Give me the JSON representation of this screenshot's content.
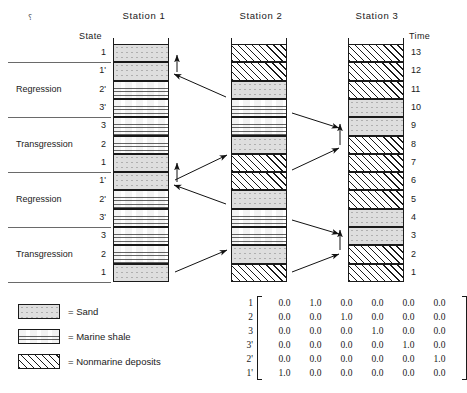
{
  "figure": {
    "state_axis_caption": "State",
    "time_axis_caption": "Time",
    "stray_mark": "⸮"
  },
  "stations": [
    {
      "title": "Station 1",
      "layers": [
        {
          "state": "1",
          "lithology": "sand"
        },
        {
          "state": "1'",
          "lithology": "sand"
        },
        {
          "state": "2'",
          "lithology": "marine-shale"
        },
        {
          "state": "3'",
          "lithology": "marine-shale"
        },
        {
          "state": "3",
          "lithology": "marine-shale"
        },
        {
          "state": "2",
          "lithology": "marine-shale"
        },
        {
          "state": "1",
          "lithology": "sand"
        },
        {
          "state": "1'",
          "lithology": "sand"
        },
        {
          "state": "2'",
          "lithology": "marine-shale"
        },
        {
          "state": "3'",
          "lithology": "marine-shale"
        },
        {
          "state": "3",
          "lithology": "marine-shale"
        },
        {
          "state": "2",
          "lithology": "marine-shale"
        },
        {
          "state": "1",
          "lithology": "sand"
        }
      ]
    },
    {
      "title": "Station 2",
      "layers": [
        {
          "lithology": "nonmarine"
        },
        {
          "lithology": "nonmarine"
        },
        {
          "lithology": "sand"
        },
        {
          "lithology": "marine-shale"
        },
        {
          "lithology": "marine-shale"
        },
        {
          "lithology": "sand"
        },
        {
          "lithology": "nonmarine"
        },
        {
          "lithology": "nonmarine"
        },
        {
          "lithology": "sand"
        },
        {
          "lithology": "marine-shale"
        },
        {
          "lithology": "marine-shale"
        },
        {
          "lithology": "sand"
        },
        {
          "lithology": "nonmarine"
        }
      ]
    },
    {
      "title": "Station 3",
      "layers": [
        {
          "time": "13",
          "lithology": "nonmarine"
        },
        {
          "time": "12",
          "lithology": "nonmarine"
        },
        {
          "time": "11",
          "lithology": "nonmarine"
        },
        {
          "time": "10",
          "lithology": "sand"
        },
        {
          "time": "9",
          "lithology": "sand"
        },
        {
          "time": "8",
          "lithology": "nonmarine"
        },
        {
          "time": "7",
          "lithology": "nonmarine"
        },
        {
          "time": "6",
          "lithology": "nonmarine"
        },
        {
          "time": "5",
          "lithology": "nonmarine"
        },
        {
          "time": "4",
          "lithology": "sand"
        },
        {
          "time": "3",
          "lithology": "sand"
        },
        {
          "time": "2",
          "lithology": "nonmarine"
        },
        {
          "time": "1",
          "lithology": "nonmarine"
        }
      ]
    }
  ],
  "cycles": [
    {
      "name": "Regression",
      "states": [
        "1'",
        "2'",
        "3'"
      ]
    },
    {
      "name": "Transgression",
      "states": [
        "3",
        "2",
        "1"
      ]
    },
    {
      "name": "Regression",
      "states": [
        "1'",
        "2'",
        "3'"
      ]
    },
    {
      "name": "Transgression",
      "states": [
        "3",
        "2",
        "1"
      ]
    }
  ],
  "legend": [
    {
      "pattern": "sand",
      "label": "= Sand"
    },
    {
      "pattern": "marine-shale",
      "label": "= Marine shale"
    },
    {
      "pattern": "nonmarine",
      "label": "= Nonmarine deposits"
    }
  ],
  "matrix": {
    "row_labels": [
      "1",
      "2",
      "3",
      "3'",
      "2'",
      "1'"
    ],
    "rows": [
      [
        "0.0",
        "1.0",
        "0.0",
        "0.0",
        "0.0",
        "0.0"
      ],
      [
        "0.0",
        "0.0",
        "1.0",
        "0.0",
        "0.0",
        "0.0"
      ],
      [
        "0.0",
        "0.0",
        "0.0",
        "1.0",
        "0.0",
        "0.0"
      ],
      [
        "0.0",
        "0.0",
        "0.0",
        "0.0",
        "1.0",
        "0.0"
      ],
      [
        "0.0",
        "0.0",
        "0.0",
        "0.0",
        "0.0",
        "1.0"
      ],
      [
        "1.0",
        "0.0",
        "0.0",
        "0.0",
        "0.0",
        "0.0"
      ]
    ]
  },
  "colors": {
    "ink": "#1a1a1a",
    "sand_fill": "#dedede",
    "shale_fill": "#f3f3f3",
    "nonmarine_fill": "#ffffff",
    "divider": "#6a6a6a"
  }
}
